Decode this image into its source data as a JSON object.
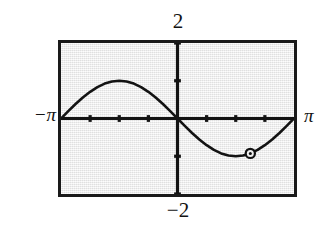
{
  "figure": {
    "kind": "graphing-calculator-plot",
    "background_color": "#ffffff",
    "plot_background_color": "#efefef",
    "frame_color": "#1a1a1a",
    "curve_color": "#131313"
  },
  "labels": {
    "top": "2",
    "bottom": "−2",
    "left": "−π",
    "right": "π"
  },
  "chart_data": {
    "type": "line",
    "title": "",
    "xlabel": "",
    "ylabel": "",
    "xlim": [
      -3.14159,
      3.14159
    ],
    "ylim": [
      -2,
      2
    ],
    "xtick_labels": [
      "−π",
      "π"
    ],
    "ytick_labels": [
      "2",
      "−2"
    ],
    "grid": false,
    "legend": null,
    "axes": {
      "x_axis_visible": true,
      "y_axis_visible": true,
      "x_axis_y_value": 0,
      "y_axis_x_value": 0,
      "x_tick_values": [
        -2.35619,
        -1.5708,
        -0.7854,
        0.7854,
        1.5708,
        2.35619
      ],
      "y_tick_values": [
        -2,
        -1,
        1,
        2
      ]
    },
    "series": [
      {
        "name": "-sin(x)",
        "expression": "y = −sin(x)",
        "x": [
          -3.14159,
          -2.94524,
          -2.74889,
          -2.55254,
          -2.35619,
          -2.15984,
          -1.9635,
          -1.76715,
          -1.5708,
          -1.37445,
          -1.1781,
          -0.98175,
          -0.7854,
          -0.58905,
          -0.3927,
          -0.19635,
          0.0,
          0.19635,
          0.3927,
          0.58905,
          0.7854,
          0.98175,
          1.1781,
          1.37445,
          1.5708,
          1.76715,
          1.9635,
          2.15984,
          2.35619,
          2.55254,
          2.74889,
          2.94524,
          3.14159
        ],
        "y": [
          0.0,
          0.19509,
          0.38268,
          0.55557,
          0.70711,
          0.83147,
          0.92388,
          0.98079,
          1.0,
          0.98079,
          0.92388,
          0.83147,
          0.70711,
          0.55557,
          0.38268,
          0.19509,
          0.0,
          -0.19509,
          -0.38268,
          -0.55557,
          -0.70711,
          -0.83147,
          -0.92388,
          -0.98079,
          -1.0,
          -0.98079,
          -0.92388,
          -0.83147,
          -0.70711,
          -0.55557,
          -0.38268,
          -0.19509,
          0.0
        ]
      }
    ],
    "annotations": [
      {
        "kind": "trace-point-marker",
        "shape": "circle-with-dot",
        "x": 1.9635,
        "y": -0.92388,
        "label": ""
      }
    ]
  }
}
